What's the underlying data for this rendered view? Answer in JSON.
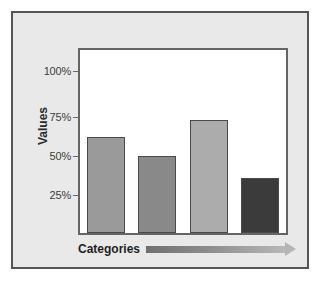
{
  "chart_data": {
    "type": "bar",
    "title": "",
    "xlabel": "Categories",
    "ylabel": "Values",
    "categories": [
      "1",
      "2",
      "3",
      "4"
    ],
    "values": [
      63,
      50.5,
      74,
      36
    ],
    "value_suffix": "%",
    "ylim": [
      0,
      120
    ],
    "yticks": [
      100,
      75,
      50,
      25
    ],
    "ytick_labels": [
      "100%",
      "75%",
      "50%",
      "25%"
    ],
    "grid": false,
    "legend": null,
    "bar_colors": [
      "#9a9a9a",
      "#898989",
      "#acacac",
      "#3b3b3b"
    ],
    "bar_edge_color": "#4a4a4a",
    "xaxis_arrow": true,
    "series": [
      {
        "name": "Values",
        "values": [
          63,
          50.5,
          74,
          36
        ]
      }
    ]
  },
  "style": {
    "panel_background": "#e9e9e9",
    "panel_border": "#555555",
    "plot_background": "#ffffff",
    "plot_border": "#656565",
    "text_color": "#2b2b2b",
    "tick_color": "#3c3c3c",
    "arrow_start_color": "#6f6f6f",
    "arrow_end_color": "#b8b8b8"
  }
}
